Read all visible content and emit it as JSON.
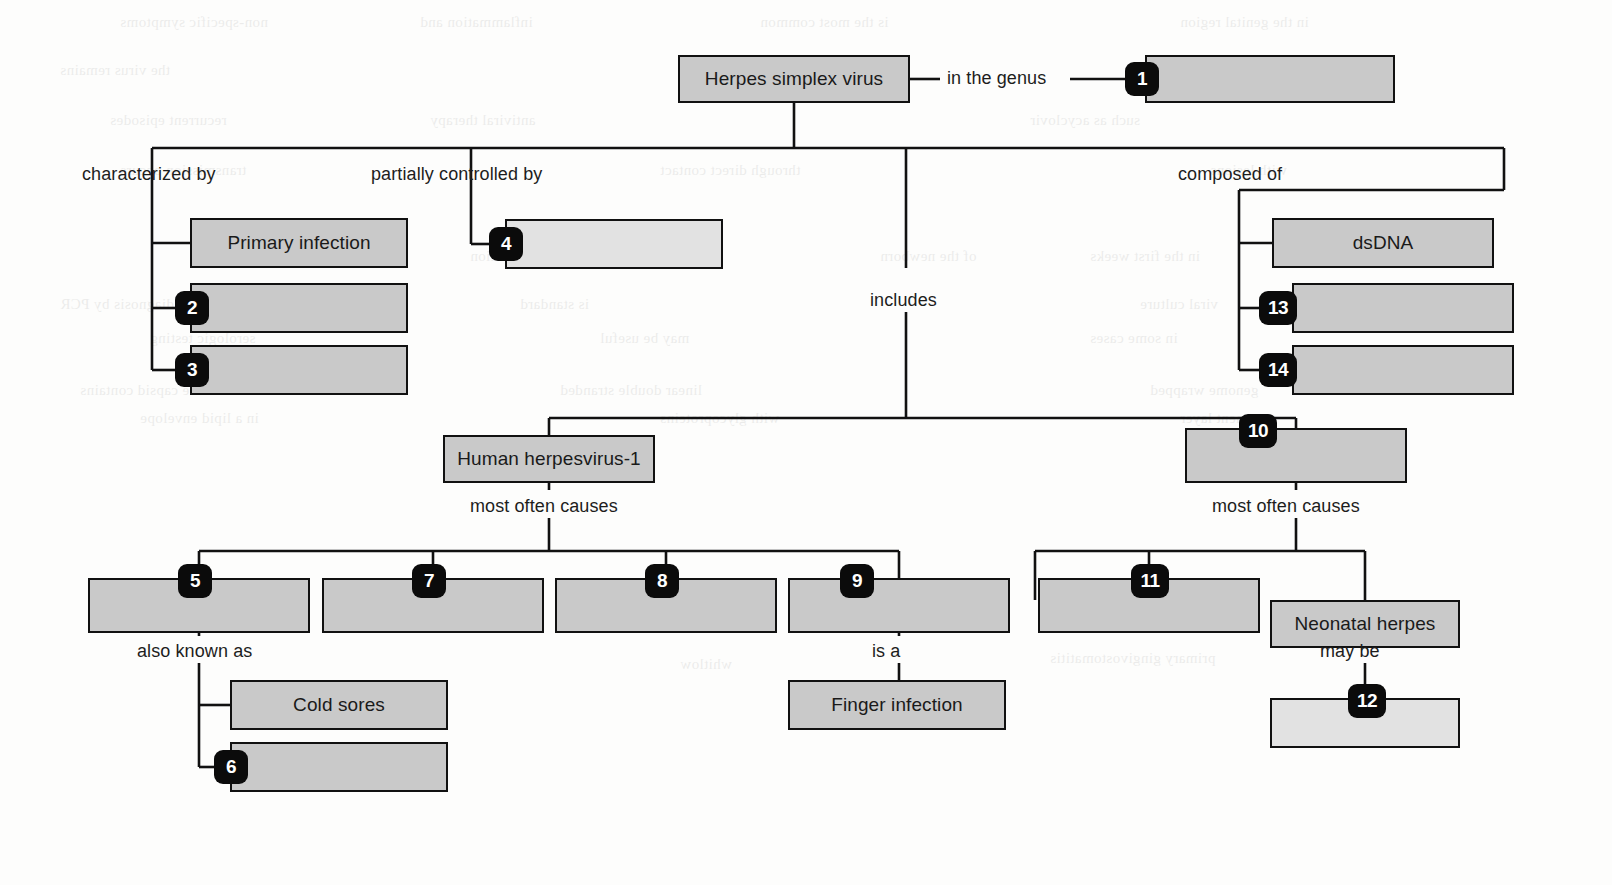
{
  "diagram": {
    "colors": {
      "box_fill": "#c9c9c9",
      "box_fill_pale": "#e2e2e2",
      "stroke": "#111111",
      "badge_fill": "#0b0b0b",
      "badge_text": "#ffffff",
      "page": "#fdfdfc"
    },
    "nodes": [
      {
        "id": "root",
        "label": "Herpes simplex virus",
        "x": 678,
        "y": 55,
        "w": 232,
        "h": 48,
        "fill": "normal"
      },
      {
        "id": "n1",
        "label": "",
        "x": 1145,
        "y": 55,
        "w": 250,
        "h": 48,
        "fill": "normal"
      },
      {
        "id": "primary",
        "label": "Primary infection",
        "x": 190,
        "y": 218,
        "w": 218,
        "h": 50,
        "fill": "normal"
      },
      {
        "id": "n2",
        "label": "",
        "x": 190,
        "y": 283,
        "w": 218,
        "h": 50,
        "fill": "normal"
      },
      {
        "id": "n3",
        "label": "",
        "x": 190,
        "y": 345,
        "w": 218,
        "h": 50,
        "fill": "normal"
      },
      {
        "id": "n4",
        "label": "",
        "x": 505,
        "y": 219,
        "w": 218,
        "h": 50,
        "fill": "pale"
      },
      {
        "id": "dsdna",
        "label": "dsDNA",
        "x": 1272,
        "y": 218,
        "w": 222,
        "h": 50,
        "fill": "normal"
      },
      {
        "id": "n13",
        "label": "",
        "x": 1292,
        "y": 283,
        "w": 222,
        "h": 50,
        "fill": "normal"
      },
      {
        "id": "n14",
        "label": "",
        "x": 1292,
        "y": 345,
        "w": 222,
        "h": 50,
        "fill": "normal"
      },
      {
        "id": "hhv1",
        "label": "Human herpesvirus-1",
        "x": 443,
        "y": 435,
        "w": 212,
        "h": 48,
        "fill": "normal"
      },
      {
        "id": "n10",
        "label": "",
        "x": 1185,
        "y": 428,
        "w": 222,
        "h": 55,
        "fill": "normal"
      },
      {
        "id": "n5",
        "label": "",
        "x": 88,
        "y": 578,
        "w": 222,
        "h": 55,
        "fill": "normal"
      },
      {
        "id": "n7",
        "label": "",
        "x": 322,
        "y": 578,
        "w": 222,
        "h": 55,
        "fill": "normal"
      },
      {
        "id": "n8",
        "label": "",
        "x": 555,
        "y": 578,
        "w": 222,
        "h": 55,
        "fill": "normal"
      },
      {
        "id": "n9",
        "label": "",
        "x": 788,
        "y": 578,
        "w": 222,
        "h": 55,
        "fill": "normal"
      },
      {
        "id": "n11",
        "label": "",
        "x": 1038,
        "y": 578,
        "w": 222,
        "h": 55,
        "fill": "normal"
      },
      {
        "id": "neonatal",
        "label": "Neonatal herpes",
        "x": 1270,
        "y": 600,
        "w": 190,
        "h": 48,
        "fill": "normal"
      },
      {
        "id": "cold",
        "label": "Cold sores",
        "x": 230,
        "y": 680,
        "w": 218,
        "h": 50,
        "fill": "normal"
      },
      {
        "id": "n6",
        "label": "",
        "x": 230,
        "y": 742,
        "w": 218,
        "h": 50,
        "fill": "normal"
      },
      {
        "id": "finger",
        "label": "Finger infection",
        "x": 788,
        "y": 680,
        "w": 218,
        "h": 50,
        "fill": "normal"
      },
      {
        "id": "n12",
        "label": "",
        "x": 1270,
        "y": 698,
        "w": 190,
        "h": 50,
        "fill": "pale"
      }
    ],
    "badges": [
      {
        "n": "1",
        "x": 1125,
        "y": 62,
        "wide": false
      },
      {
        "n": "2",
        "x": 175,
        "y": 291,
        "wide": false
      },
      {
        "n": "3",
        "x": 175,
        "y": 353,
        "wide": false
      },
      {
        "n": "4",
        "x": 489,
        "y": 227,
        "wide": false
      },
      {
        "n": "5",
        "x": 178,
        "y": 564,
        "wide": false
      },
      {
        "n": "6",
        "x": 214,
        "y": 750,
        "wide": false
      },
      {
        "n": "7",
        "x": 412,
        "y": 564,
        "wide": false
      },
      {
        "n": "8",
        "x": 645,
        "y": 564,
        "wide": false
      },
      {
        "n": "9",
        "x": 840,
        "y": 564,
        "wide": false
      },
      {
        "n": "10",
        "x": 1239,
        "y": 414,
        "wide": true
      },
      {
        "n": "11",
        "x": 1131,
        "y": 564,
        "wide": true
      },
      {
        "n": "12",
        "x": 1348,
        "y": 684,
        "wide": true
      },
      {
        "n": "13",
        "x": 1259,
        "y": 291,
        "wide": true
      },
      {
        "n": "14",
        "x": 1259,
        "y": 353,
        "wide": true
      }
    ],
    "link_labels": [
      {
        "id": "in-the-genus",
        "text": "in the genus",
        "x": 947,
        "y": 68,
        "align": "left"
      },
      {
        "id": "characterized-by",
        "text": "characterized by",
        "x": 82,
        "y": 164,
        "align": "left"
      },
      {
        "id": "partially-controlled-by",
        "text": "partially controlled by",
        "x": 371,
        "y": 164,
        "align": "left"
      },
      {
        "id": "includes",
        "text": "includes",
        "x": 870,
        "y": 290,
        "align": "left"
      },
      {
        "id": "composed-of",
        "text": "composed of",
        "x": 1178,
        "y": 164,
        "align": "left"
      },
      {
        "id": "most-often-causes-left",
        "text": "most often causes",
        "x": 470,
        "y": 496,
        "align": "left"
      },
      {
        "id": "most-often-causes-right",
        "text": "most often causes",
        "x": 1212,
        "y": 496,
        "align": "left"
      },
      {
        "id": "also-known-as",
        "text": "also known as",
        "x": 137,
        "y": 641,
        "align": "left"
      },
      {
        "id": "is-a",
        "text": "is a",
        "x": 872,
        "y": 641,
        "align": "left"
      },
      {
        "id": "may-be",
        "text": "may be",
        "x": 1320,
        "y": 641,
        "align": "left"
      }
    ],
    "bleed_text": [
      {
        "t": "non-specific symptoms",
        "x": 120,
        "y": 14
      },
      {
        "t": "inflammation and",
        "x": 420,
        "y": 14
      },
      {
        "t": "is the most common",
        "x": 760,
        "y": 14
      },
      {
        "t": "in the genital region",
        "x": 1180,
        "y": 14
      },
      {
        "t": "the virus remains",
        "x": 60,
        "y": 62
      },
      {
        "t": "latent in the",
        "x": 1210,
        "y": 62
      },
      {
        "t": "recurrent episodes",
        "x": 110,
        "y": 112
      },
      {
        "t": "antiviral therapy",
        "x": 430,
        "y": 112
      },
      {
        "t": "such as acyclovir",
        "x": 1030,
        "y": 112
      },
      {
        "t": "transmission occurs",
        "x": 120,
        "y": 162
      },
      {
        "t": "through direct contact",
        "x": 660,
        "y": 162
      },
      {
        "t": "with lesions",
        "x": 1210,
        "y": 162
      },
      {
        "t": "neonatal infection",
        "x": 470,
        "y": 248
      },
      {
        "t": "of the newborn",
        "x": 880,
        "y": 248
      },
      {
        "t": "in the first weeks",
        "x": 1090,
        "y": 248
      },
      {
        "t": "diagnosis by PCR",
        "x": 60,
        "y": 296
      },
      {
        "t": "is standard",
        "x": 520,
        "y": 296
      },
      {
        "t": "viral culture",
        "x": 1140,
        "y": 296
      },
      {
        "t": "serologic testing",
        "x": 150,
        "y": 330
      },
      {
        "t": "may be useful",
        "x": 600,
        "y": 330
      },
      {
        "t": "in some cases",
        "x": 1090,
        "y": 330
      },
      {
        "t": "the capsid contains",
        "x": 80,
        "y": 382
      },
      {
        "t": "linear double stranded",
        "x": 560,
        "y": 382
      },
      {
        "t": "genome wrapped",
        "x": 1150,
        "y": 382
      },
      {
        "t": "in a lipid envelope",
        "x": 140,
        "y": 410
      },
      {
        "t": "with glycoproteins",
        "x": 660,
        "y": 410
      },
      {
        "t": "tegument layer",
        "x": 1180,
        "y": 410
      },
      {
        "t": "primary gingivostomatitis",
        "x": 1050,
        "y": 650
      },
      {
        "t": "whitlow",
        "x": 680,
        "y": 656
      }
    ]
  }
}
